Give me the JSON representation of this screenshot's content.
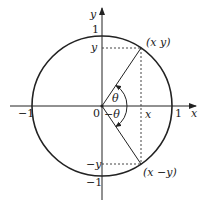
{
  "diagram": {
    "axes": {
      "x_label": "x",
      "y_label": "y"
    },
    "origin_label": "0",
    "ticks": {
      "x_pos": "1",
      "x_neg": "−1",
      "y_pos": "1",
      "y_neg": "−1",
      "x_coord": "x",
      "y_coord": "y",
      "y_coord_neg": "−y"
    },
    "points": {
      "upper": "(x  y)",
      "lower": "(x  −y)"
    },
    "angles": {
      "upper": "θ",
      "lower": "−θ"
    },
    "colors": {
      "stroke": "#222222",
      "dashed": "#444444",
      "background": "#ffffff"
    }
  }
}
